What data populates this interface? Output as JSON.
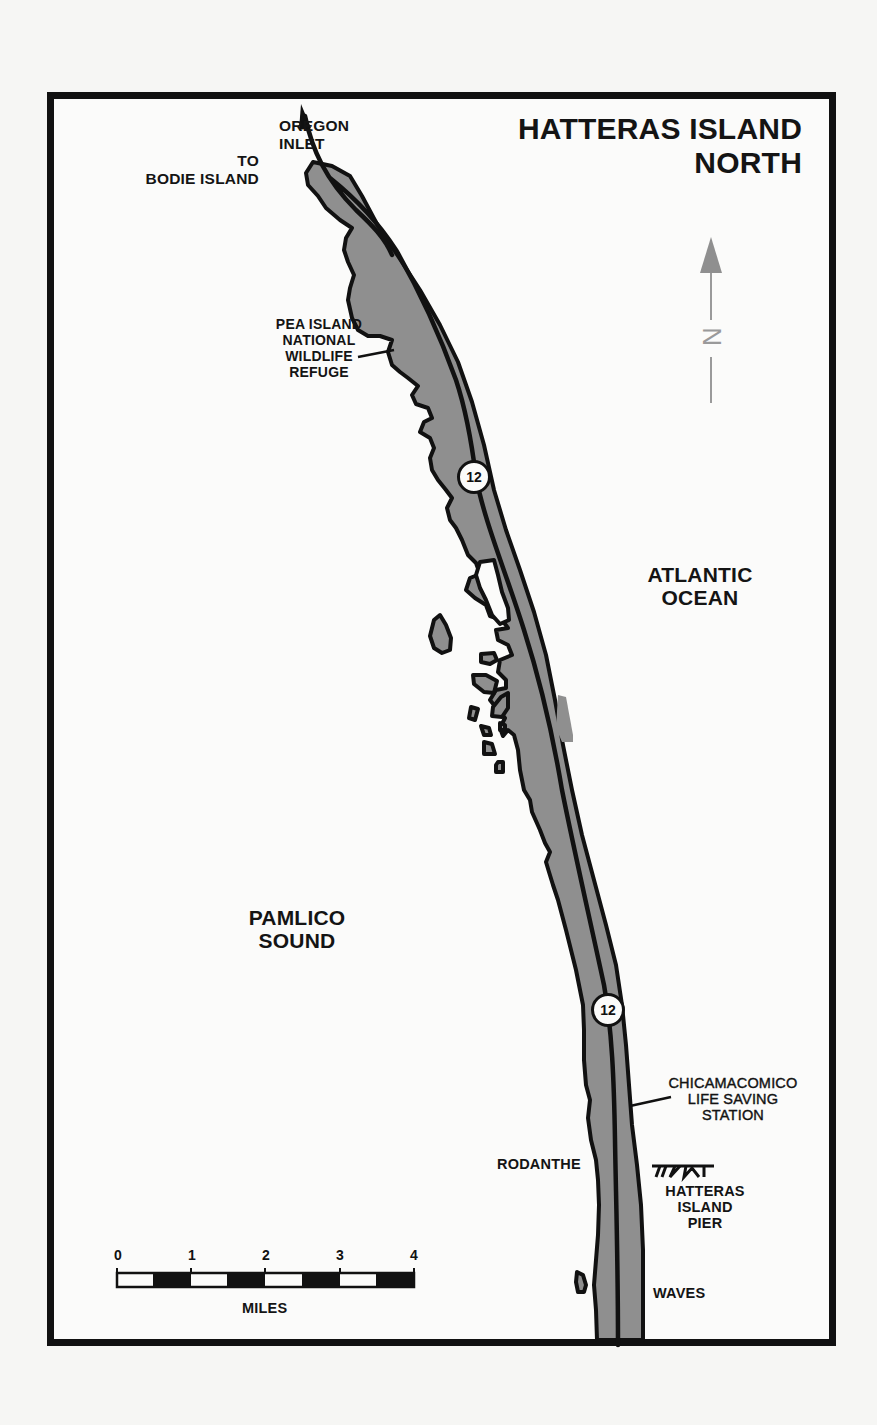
{
  "map": {
    "title_line1": "HATTERAS ISLAND",
    "title_line2": "NORTH",
    "colors": {
      "land": "#8f8f8f",
      "outline": "#111111",
      "paper": "#fbfbfa",
      "north_arrow": "#8f8f8f"
    },
    "north_arrow": {
      "label": "N",
      "icon": "north-arrow-icon"
    },
    "labels": {
      "oregon_inlet_1": "OREGON",
      "oregon_inlet_2": "INLET",
      "to_bodie_1": "TO",
      "to_bodie_2": "BODIE ISLAND",
      "pea_island_1": "PEA ISLAND",
      "pea_island_2": "NATIONAL",
      "pea_island_3": "WILDLIFE",
      "pea_island_4": "REFUGE",
      "atlantic_1": "ATLANTIC",
      "atlantic_2": "OCEAN",
      "pamlico_1": "PAMLICO",
      "pamlico_2": "SOUND",
      "chicamacomico_1": "CHICAMACOMICO",
      "chicamacomico_2": "LIFE SAVING",
      "chicamacomico_3": "STATION",
      "rodanthe": "RODANTHE",
      "pier_1": "HATTERAS",
      "pier_2": "ISLAND",
      "pier_3": "PIER",
      "waves": "WAVES"
    },
    "route_shields": [
      {
        "number": "12"
      },
      {
        "number": "12"
      }
    ],
    "scale_bar": {
      "ticks": [
        "0",
        "1",
        "2",
        "3",
        "4"
      ],
      "unit": "MILES"
    }
  }
}
